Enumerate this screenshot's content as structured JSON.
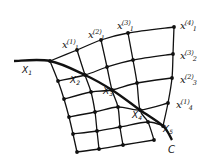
{
  "figure": {
    "curve_label": "C",
    "characteristic_points": [
      {
        "name": "X",
        "index": "1",
        "x": 22,
        "y": 66
      },
      {
        "name": "X",
        "index": "2",
        "x": 70,
        "y": 76
      },
      {
        "name": "X",
        "index": "3",
        "x": 103,
        "y": 87
      },
      {
        "name": "X",
        "index": "4",
        "x": 132,
        "y": 111
      },
      {
        "name": "X",
        "index": "5",
        "x": 163,
        "y": 125
      }
    ],
    "grid_labels": [
      {
        "name": "x",
        "sub": "1",
        "sup": "(1)",
        "x": 62,
        "y": 37
      },
      {
        "name": "x",
        "sub": "1",
        "sup": "(2)",
        "x": 88,
        "y": 27
      },
      {
        "name": "x",
        "sub": "1",
        "sup": "(3)",
        "x": 117,
        "y": 18
      },
      {
        "name": "x",
        "sub": "1",
        "sup": "(4)",
        "x": 180,
        "y": 18
      },
      {
        "name": "x",
        "sub": "2",
        "sup": "(3)",
        "x": 180,
        "y": 48
      },
      {
        "name": "x",
        "sub": "3",
        "sup": "(2)",
        "x": 180,
        "y": 72
      },
      {
        "name": "x",
        "sub": "4",
        "sup": "(1)",
        "x": 176,
        "y": 97
      }
    ],
    "curve_label_pos": {
      "x": 168,
      "y": 145
    },
    "curve_C": [
      [
        14,
        61
      ],
      [
        50,
        61
      ],
      [
        85,
        75
      ],
      [
        112,
        90
      ],
      [
        140,
        110
      ],
      [
        163,
        126
      ],
      [
        172,
        140
      ]
    ],
    "grid_rows": [
      [
        [
          50,
          61
        ],
        [
          77,
          50
        ],
        [
          101,
          40
        ],
        [
          128,
          33
        ],
        [
          174,
          27
        ]
      ],
      [
        [
          58,
          81
        ],
        [
          85,
          75
        ],
        [
          107,
          67
        ],
        [
          133,
          60
        ],
        [
          173,
          54
        ]
      ],
      [
        [
          64,
          99
        ],
        [
          91,
          92
        ],
        [
          112,
          90
        ],
        [
          137,
          83
        ],
        [
          172,
          78
        ]
      ],
      [
        [
          69,
          117
        ],
        [
          95,
          112
        ],
        [
          118,
          107
        ],
        [
          140,
          110
        ],
        [
          168,
          103
        ]
      ],
      [
        [
          73,
          134
        ],
        [
          97,
          131
        ],
        [
          120,
          127
        ],
        [
          148,
          122
        ],
        [
          163,
          126
        ]
      ],
      [
        [
          77,
          152
        ],
        [
          99,
          149
        ],
        [
          123,
          145
        ],
        [
          154,
          140
        ]
      ]
    ],
    "grid_cols": [
      [
        [
          50,
          61
        ],
        [
          58,
          81
        ],
        [
          64,
          99
        ],
        [
          69,
          117
        ],
        [
          73,
          134
        ],
        [
          77,
          152
        ]
      ],
      [
        [
          77,
          50
        ],
        [
          85,
          75
        ],
        [
          91,
          92
        ],
        [
          95,
          112
        ],
        [
          97,
          131
        ],
        [
          99,
          149
        ]
      ],
      [
        [
          101,
          40
        ],
        [
          107,
          67
        ],
        [
          112,
          90
        ],
        [
          118,
          107
        ],
        [
          120,
          127
        ],
        [
          123,
          145
        ]
      ],
      [
        [
          128,
          33
        ],
        [
          133,
          60
        ],
        [
          137,
          83
        ],
        [
          140,
          110
        ],
        [
          148,
          122
        ],
        [
          154,
          140
        ]
      ],
      [
        [
          174,
          27
        ],
        [
          173,
          54
        ],
        [
          172,
          78
        ],
        [
          168,
          103
        ],
        [
          163,
          126
        ]
      ]
    ],
    "node_dots": [
      [
        77,
        50
      ],
      [
        101,
        40
      ],
      [
        128,
        33
      ],
      [
        174,
        27
      ],
      [
        173,
        54
      ],
      [
        172,
        78
      ],
      [
        168,
        103
      ],
      [
        50,
        61
      ],
      [
        85,
        75
      ],
      [
        112,
        90
      ],
      [
        140,
        110
      ],
      [
        163,
        126
      ],
      [
        58,
        81
      ],
      [
        64,
        99
      ],
      [
        69,
        117
      ],
      [
        73,
        134
      ],
      [
        77,
        152
      ],
      [
        91,
        92
      ],
      [
        95,
        112
      ],
      [
        97,
        131
      ],
      [
        99,
        149
      ],
      [
        107,
        67
      ],
      [
        118,
        107
      ],
      [
        120,
        127
      ],
      [
        123,
        145
      ],
      [
        133,
        60
      ],
      [
        137,
        83
      ],
      [
        148,
        122
      ],
      [
        154,
        140
      ]
    ],
    "colors": {
      "ink": "#111111",
      "background": "#ffffff"
    }
  }
}
